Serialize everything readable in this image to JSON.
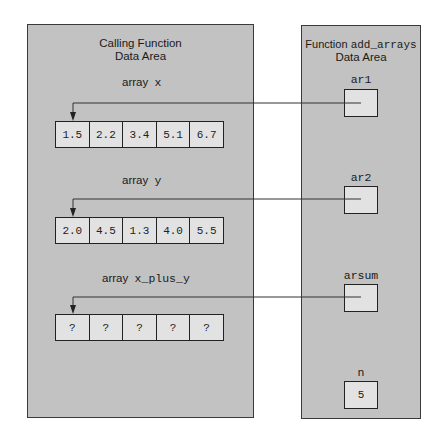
{
  "calling_area": {
    "title_line1": "Calling Function",
    "title_line2": "Data Area",
    "arrays": [
      {
        "label_prefix": "array",
        "label_name": "x",
        "values": [
          "1.5",
          "2.2",
          "3.4",
          "5.1",
          "6.7"
        ]
      },
      {
        "label_prefix": "array",
        "label_name": "y",
        "values": [
          "2.0",
          "4.5",
          "1.3",
          "4.0",
          "5.5"
        ]
      },
      {
        "label_prefix": "array",
        "label_name": "x_plus_y",
        "values": [
          "?",
          "?",
          "?",
          "?",
          "?"
        ]
      }
    ]
  },
  "function_area": {
    "title_prefix": "Function",
    "title_name": "add_arrays",
    "title_line2": "Data Area",
    "params": [
      {
        "name": "ar1",
        "value": ""
      },
      {
        "name": "ar2",
        "value": ""
      },
      {
        "name": "arsum",
        "value": ""
      },
      {
        "name": "n",
        "value": "5"
      }
    ]
  },
  "colors": {
    "panel": "#c2c2c2",
    "cell": "#e2e2e2",
    "line": "#222222"
  }
}
